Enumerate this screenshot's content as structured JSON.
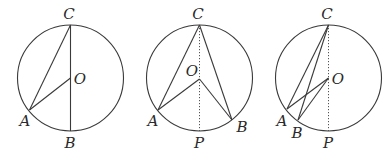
{
  "figures": [
    {
      "id": "fig1",
      "circle": {
        "cx": 70.5,
        "cy": 78,
        "r": 53
      },
      "points": {
        "C": {
          "x": 70.5,
          "y": 25
        },
        "O": {
          "x": 70.5,
          "y": 78
        },
        "A": {
          "x": 29.5,
          "y": 110
        },
        "B": {
          "x": 70.5,
          "y": 131
        }
      },
      "segments": [
        [
          "C",
          "A"
        ],
        [
          "A",
          "O"
        ],
        [
          "C",
          "B"
        ]
      ],
      "dashed": [],
      "labels": [
        {
          "text": "C",
          "x": 69,
          "y": 19
        },
        {
          "text": "O",
          "x": 80,
          "y": 84
        },
        {
          "text": "A",
          "x": 25,
          "y": 126
        },
        {
          "text": "B",
          "x": 70,
          "y": 148
        }
      ]
    },
    {
      "id": "fig2",
      "circle": {
        "cx": 199.5,
        "cy": 78,
        "r": 53
      },
      "points": {
        "C": {
          "x": 199.5,
          "y": 25
        },
        "O": {
          "x": 199.5,
          "y": 79
        },
        "A": {
          "x": 158,
          "y": 110
        },
        "B": {
          "x": 232,
          "y": 120
        },
        "P": {
          "x": 199.5,
          "y": 131
        }
      },
      "segments": [
        [
          "C",
          "A"
        ],
        [
          "A",
          "O"
        ],
        [
          "O",
          "B"
        ],
        [
          "C",
          "B"
        ]
      ],
      "dashed": [
        [
          "C",
          "P"
        ]
      ],
      "labels": [
        {
          "text": "C",
          "x": 198,
          "y": 19
        },
        {
          "text": "O",
          "x": 192,
          "y": 76
        },
        {
          "text": "A",
          "x": 153,
          "y": 126
        },
        {
          "text": "B",
          "x": 242,
          "y": 132
        },
        {
          "text": "P",
          "x": 199,
          "y": 148
        }
      ]
    },
    {
      "id": "fig3",
      "circle": {
        "cx": 328.5,
        "cy": 78,
        "r": 53
      },
      "points": {
        "C": {
          "x": 328.5,
          "y": 25
        },
        "O": {
          "x": 328.5,
          "y": 78
        },
        "A": {
          "x": 287,
          "y": 109
        },
        "B": {
          "x": 298,
          "y": 120
        },
        "P": {
          "x": 328.5,
          "y": 131
        }
      },
      "segments": [
        [
          "C",
          "A"
        ],
        [
          "C",
          "B"
        ],
        [
          "A",
          "O"
        ],
        [
          "B",
          "O"
        ]
      ],
      "dashed": [
        [
          "C",
          "P"
        ]
      ],
      "labels": [
        {
          "text": "C",
          "x": 327,
          "y": 19
        },
        {
          "text": "O",
          "x": 338,
          "y": 84
        },
        {
          "text": "A",
          "x": 282,
          "y": 126
        },
        {
          "text": "B",
          "x": 297,
          "y": 138
        },
        {
          "text": "P",
          "x": 328,
          "y": 148
        }
      ]
    }
  ]
}
